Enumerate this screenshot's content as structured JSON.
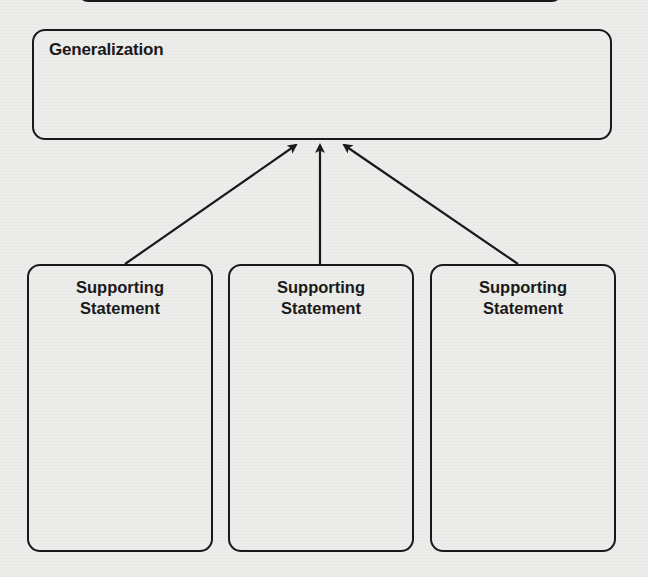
{
  "diagram": {
    "generalization": {
      "label": "Generalization"
    },
    "supporting_statements": [
      {
        "label": "Supporting\nStatement"
      },
      {
        "label": "Supporting\nStatement"
      },
      {
        "label": "Supporting\nStatement"
      }
    ],
    "connections": [
      {
        "from": "supporting-statement-1",
        "to": "generalization",
        "type": "arrow"
      },
      {
        "from": "supporting-statement-2",
        "to": "generalization",
        "type": "arrow"
      },
      {
        "from": "supporting-statement-3",
        "to": "generalization",
        "type": "arrow"
      }
    ],
    "colors": {
      "stroke": "#1a1a1a",
      "text": "#1a1a1a",
      "background": "#ececea"
    }
  }
}
